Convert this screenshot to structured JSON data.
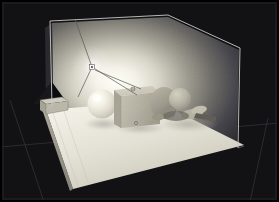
{
  "app": {
    "view_title": "3D Viewport",
    "render_mode": "shaded-preview"
  },
  "canvas": {
    "width": 279,
    "height": 202,
    "background_color": "#111114",
    "border_color": "#000000",
    "grid_line_color": "#3a3a40",
    "grid_lines": [
      {
        "name": "horizon-grid-line",
        "x1": 0,
        "y1": 146,
        "x2": 279,
        "y2": 124
      },
      {
        "name": "vertical-grid-line",
        "x1": 41,
        "y1": 202,
        "x2": 7,
        "y2": 104
      },
      {
        "name": "right-grid-line",
        "x1": 246,
        "y1": 202,
        "x2": 266,
        "y2": 120
      }
    ]
  },
  "scene": {
    "name": "interior-light-study",
    "wireframe_box": {
      "name": "room-bounding-box",
      "edge_color": "#c9c9c4",
      "vertices": {
        "top_back_left": [
          50,
          21
        ],
        "top_apex": [
          168,
          15
        ],
        "top_right": [
          240,
          48
        ],
        "bottom_right": [
          238,
          148
        ],
        "bottom_left": [
          52,
          104
        ],
        "inner_vertical": [
          50,
          21,
          50,
          104
        ]
      }
    },
    "back_wall": {
      "name": "back-wall-plane",
      "gradient_center_color": "#fdfdf8",
      "gradient_edge_color": "#2a2a2c",
      "hotspot": [
        96,
        72
      ]
    },
    "floor_plane": {
      "name": "floor-plane",
      "fill_color": "#e8e7dd",
      "shade_color": "#cfcdc0",
      "corners": [
        [
          45,
          110
        ],
        [
          155,
          101
        ],
        [
          243,
          146
        ],
        [
          72,
          188
        ]
      ]
    },
    "objects": [
      {
        "name": "sphere",
        "type": "sphere",
        "center": [
          102,
          104
        ],
        "radius": 14,
        "highlight_color": "#fffff4",
        "base_color": "#d6d4c6",
        "label": "Sphere"
      },
      {
        "name": "cube",
        "type": "box",
        "position": [
          114,
          90
        ],
        "size": [
          46,
          42
        ],
        "face_color": "#b6b2a4",
        "top_color": "#cdc9ba",
        "side_color": "#9d998c",
        "label": "Cube"
      },
      {
        "name": "mannequin-figure",
        "type": "mesh",
        "position": [
          162,
          92
        ],
        "body_color": "#a8a496",
        "head_color": "#c2bdae",
        "shadow_color": "#7c796e",
        "label": "Figure"
      },
      {
        "name": "pyramid-cone",
        "type": "cone",
        "apex": [
          52,
          83
        ],
        "base_left": [
          32,
          104
        ],
        "base_right": [
          72,
          104
        ],
        "fill_color": "#0a0a0c",
        "label": "Cone"
      },
      {
        "name": "small-box-widget",
        "type": "box",
        "position": [
          44,
          100
        ],
        "size": [
          22,
          14
        ],
        "fill_color": "#c6c3b6",
        "label": "Helper Box"
      }
    ],
    "light": {
      "name": "point-light-gizmo",
      "position": [
        92,
        67
      ],
      "marker_color": "#ffffff",
      "ray_color": "#6d6b63",
      "rays": [
        {
          "to": [
            75,
            20
          ]
        },
        {
          "to": [
            133,
            95
          ]
        },
        {
          "to": [
            77,
            96
          ]
        },
        {
          "to": [
            140,
            88
          ]
        }
      ],
      "secondary_marker": [
        133,
        89
      ],
      "intensity_label": "1.0"
    },
    "shadows": [
      {
        "name": "sphere-shadow",
        "cx": 104,
        "cy": 124,
        "rx": 18,
        "ry": 5,
        "color": "#b9b6a9"
      },
      {
        "name": "figure-shadow",
        "cx": 186,
        "cy": 124,
        "rx": 28,
        "ry": 7,
        "color": "#aaa79a"
      }
    ]
  },
  "icons": {
    "light_marker": "light-gizmo-icon",
    "anchor_marker": "anchor-point-icon"
  }
}
